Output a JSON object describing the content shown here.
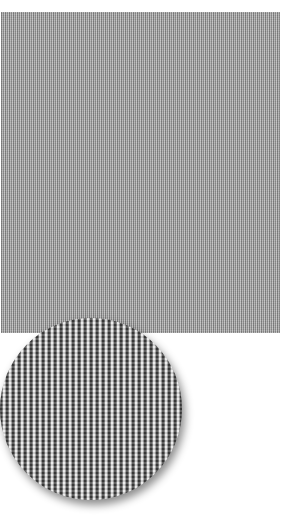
{
  "image": {
    "subject": "fabric swatch with magnified detail",
    "swatch": {
      "description": "grey vertical pinstripe fabric texture",
      "color": "#9a9a9a"
    },
    "zoom_detail": {
      "shape": "circle",
      "description": "magnified view of ribbed weave",
      "dark_color": "#3e3e3e",
      "light_color": "#e8e8e8"
    }
  }
}
